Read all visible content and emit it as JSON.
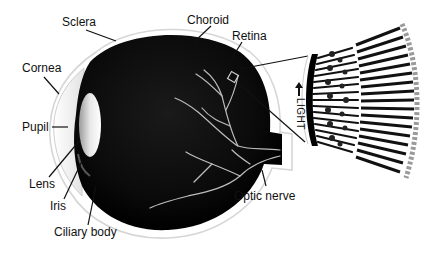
{
  "diagram": {
    "labels": {
      "sclera": "Sclera",
      "choroid": "Choroid",
      "retina": "Retina",
      "cornea": "Cornea",
      "pupil": "Pupil",
      "lens": "Lens",
      "iris": "Iris",
      "ciliary_body": "Ciliary body",
      "optic_nerve": "Optic nerve",
      "light": "LIGHT"
    },
    "colors": {
      "eyeball": "#0a0a0a",
      "sclera_outline": "#d8d8d8",
      "vessels": "#bdbdbd",
      "lens_highlight": "#f4f4f4",
      "text": "#111111",
      "background": "#ffffff"
    },
    "inset": {
      "description": "Magnified retina layer showing photoreceptor cells",
      "direction_arrow": "up"
    }
  }
}
